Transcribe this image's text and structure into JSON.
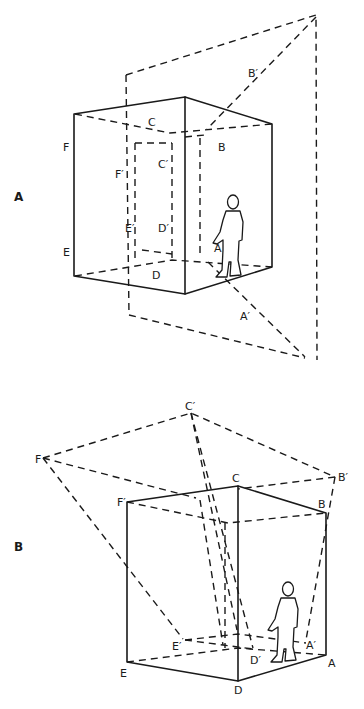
{
  "figure_a": {
    "panel_label": "A",
    "labels": {
      "C": "C",
      "B": "B",
      "F": "F",
      "E": "E",
      "D": "D",
      "A": "A",
      "B_prime": "B′",
      "C_prime": "C′",
      "F_prime": "F′",
      "E_prime": "E′",
      "D_prime": "D′",
      "A_prime": "A′"
    }
  },
  "figure_b": {
    "panel_label": "B",
    "labels": {
      "C": "C",
      "B": "B",
      "F": "F",
      "E": "E",
      "D": "D",
      "A": "A",
      "B_prime": "B′",
      "C_prime": "C′",
      "F_prime": "F′",
      "E_prime": "E′",
      "D_prime": "D′",
      "A_prime": "A′"
    }
  }
}
